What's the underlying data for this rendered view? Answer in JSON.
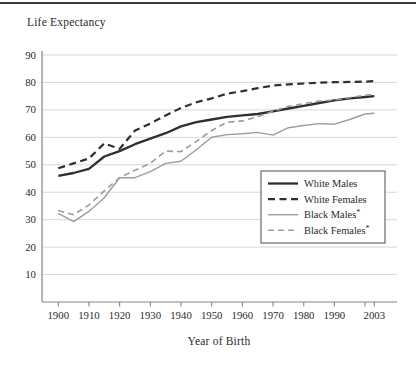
{
  "chart_data": {
    "type": "line",
    "title": "Life Expectancy",
    "xlabel": "Year of Birth",
    "ylabel": "Life Expectancy",
    "grid": "horizontal",
    "ylim": [
      0,
      90
    ],
    "y_ticks": [
      10,
      20,
      30,
      40,
      50,
      60,
      70,
      80,
      90
    ],
    "x_ticks": [
      {
        "value": 1900,
        "label": "1900"
      },
      {
        "value": 1910,
        "label": "1910"
      },
      {
        "value": 1920,
        "label": "1920"
      },
      {
        "value": 1930,
        "label": "1930"
      },
      {
        "value": 1940,
        "label": "1940"
      },
      {
        "value": 1950,
        "label": "1950"
      },
      {
        "value": 1960,
        "label": "1960"
      },
      {
        "value": 1970,
        "label": "1970"
      },
      {
        "value": 1980,
        "label": "1980"
      },
      {
        "value": 1990,
        "label": "1990"
      },
      {
        "value": 2000,
        "label": ""
      },
      {
        "value": 2003,
        "label": "2003"
      }
    ],
    "x": [
      1900,
      1905,
      1910,
      1915,
      1920,
      1925,
      1930,
      1935,
      1940,
      1945,
      1950,
      1955,
      1960,
      1965,
      1970,
      1975,
      1980,
      1985,
      1990,
      1995,
      2000,
      2003
    ],
    "series": [
      {
        "name": "White Males",
        "color": "#2f2f2f",
        "style": "solid",
        "width": 2.3,
        "values": [
          46.0,
          47.0,
          48.5,
          53.0,
          55.0,
          57.5,
          59.5,
          61.5,
          64.0,
          65.5,
          66.5,
          67.5,
          68.0,
          68.5,
          69.5,
          70.5,
          71.5,
          72.5,
          73.5,
          74.2,
          74.7,
          75.0
        ]
      },
      {
        "name": "White Females",
        "color": "#2f2f2f",
        "style": "dashed",
        "dasharray": "7,4.5",
        "width": 2.2,
        "values": [
          48.7,
          50.5,
          52.3,
          57.8,
          55.8,
          62.5,
          65.0,
          68.0,
          70.7,
          72.8,
          74.2,
          75.9,
          76.8,
          77.9,
          78.9,
          79.3,
          79.6,
          79.9,
          80.1,
          80.2,
          80.3,
          80.5
        ]
      },
      {
        "name": "Black Males*",
        "color": "#9d9d9d",
        "style": "solid",
        "width": 1.4,
        "values": [
          32.3,
          29.3,
          33.0,
          38.0,
          45.3,
          45.3,
          47.5,
          50.5,
          51.3,
          55.5,
          60.0,
          61.0,
          61.3,
          61.8,
          60.8,
          63.5,
          64.3,
          65.0,
          64.8,
          66.5,
          68.5,
          68.8
        ]
      },
      {
        "name": "Black Females*",
        "color": "#9d9d9d",
        "style": "dashed",
        "dasharray": "6,4",
        "width": 1.6,
        "values": [
          33.3,
          31.8,
          35.3,
          40.5,
          45.3,
          48.0,
          50.5,
          55.0,
          54.8,
          58.5,
          62.5,
          65.5,
          66.0,
          67.5,
          69.5,
          71.3,
          72.3,
          73.2,
          73.6,
          74.5,
          75.3,
          75.8
        ]
      }
    ],
    "legend": {
      "position": "lower-right",
      "border": true
    }
  },
  "style": {
    "gridline_color": "#d7d7d7",
    "axis_color": "#858585",
    "text_color": "#2b2b2b",
    "legend_border_color": "#4d4d4d",
    "background": "#ffffff"
  }
}
